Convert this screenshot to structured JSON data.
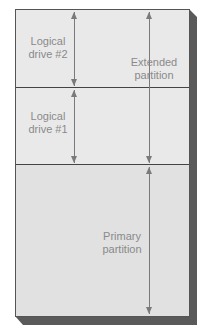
{
  "diagram": {
    "title": "",
    "segments": [
      {
        "id": "logical-drive-2",
        "label_line1": "Logical",
        "label_line2": "drive #2"
      },
      {
        "id": "logical-drive-1",
        "label_line1": "Logical",
        "label_line2": "drive #1"
      },
      {
        "id": "primary-partition",
        "label_line1": "Primary",
        "label_line2": "partition"
      }
    ],
    "extended": {
      "label_line1": "Extended",
      "label_line2": "partition"
    },
    "colors": {
      "fill": "#e9e9e9",
      "shadow": "#5a5a5a",
      "text": "#8a8a8a",
      "line": "#444444"
    }
  }
}
